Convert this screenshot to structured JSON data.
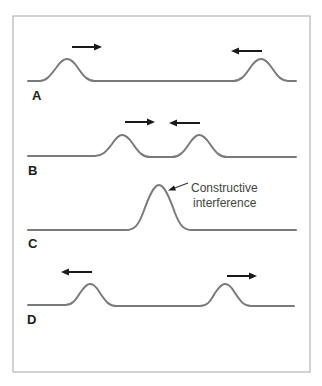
{
  "figure": {
    "panels": [
      {
        "label": "A",
        "description": "Two pulses approaching each other",
        "arrows": [
          "right",
          "left"
        ]
      },
      {
        "label": "B",
        "description": "Pulses close together",
        "arrows": [
          "right",
          "left"
        ]
      },
      {
        "label": "C",
        "description": "Pulses overlap",
        "annotation_line1": "Constructive",
        "annotation_line2": "interference"
      },
      {
        "label": "D",
        "description": "Pulses moving apart",
        "arrows": [
          "left",
          "right"
        ]
      }
    ],
    "colors": {
      "wave": "#7a7a7a",
      "arrow": "#1a1a1a",
      "frame": "#b5b5b5"
    }
  }
}
